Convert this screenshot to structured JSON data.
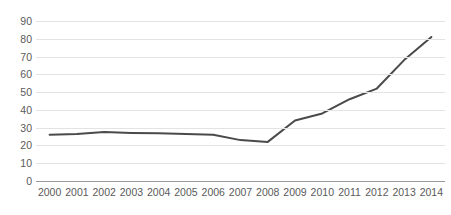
{
  "chart_data": {
    "type": "line",
    "title": "",
    "subtitle": "",
    "xlabel": "",
    "ylabel": "",
    "categories": [
      "2000",
      "2001",
      "2002",
      "2003",
      "2004",
      "2005",
      "2006",
      "2007",
      "2008",
      "2009",
      "2010",
      "2011",
      "2012",
      "2013",
      "2014"
    ],
    "x": [
      2000,
      2001,
      2002,
      2003,
      2004,
      2005,
      2006,
      2007,
      2008,
      2009,
      2010,
      2011,
      2012,
      2013,
      2014
    ],
    "values": [
      26,
      26.5,
      27.5,
      27,
      26.8,
      26.5,
      26,
      23,
      22,
      34,
      38,
      46,
      52,
      68,
      81
    ],
    "series": [
      {
        "name": "",
        "values": [
          26,
          26.5,
          27.5,
          27,
          26.8,
          26.5,
          26,
          23,
          22,
          34,
          38,
          46,
          52,
          68,
          81
        ]
      }
    ],
    "ylim": [
      0,
      90
    ],
    "yticks": [
      0,
      10,
      20,
      30,
      40,
      50,
      60,
      70,
      80,
      90
    ],
    "ytick_labels": [
      "0",
      "10",
      "20",
      "30",
      "40",
      "50",
      "60",
      "70",
      "80",
      "90"
    ],
    "xtick_labels": [
      "2000",
      "2001",
      "2002",
      "2003",
      "2004",
      "2005",
      "2006",
      "2007",
      "2008",
      "2009",
      "2010",
      "2011",
      "2012",
      "2013",
      "2014"
    ],
    "grid": true,
    "grid_axis": "y",
    "legend": false,
    "legend_position": "none",
    "annotations": [],
    "colors": {
      "line": "#4a4a4a",
      "gridline": "#e3e3e3",
      "baseline": "#9a9a9a",
      "tick_label": "#5a5a5a",
      "background": "#ffffff"
    },
    "line_width": 2
  }
}
